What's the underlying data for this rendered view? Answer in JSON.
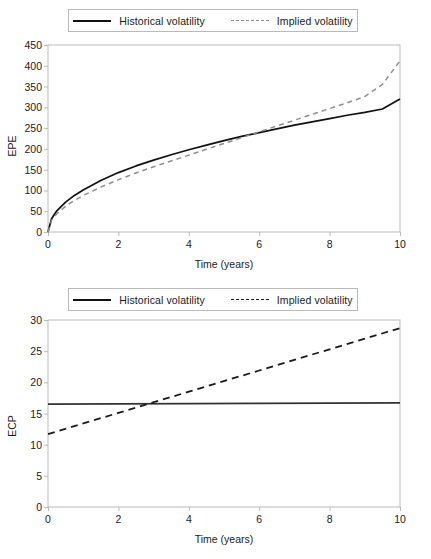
{
  "chart_data": [
    {
      "type": "line",
      "id": "epe-chart",
      "title": "",
      "xlabel": "Time (years)",
      "ylabel": "EPE",
      "xlim": [
        0,
        10
      ],
      "ylim": [
        0,
        450
      ],
      "xticks": [
        0,
        2,
        4,
        6,
        8,
        10
      ],
      "yticks": [
        0,
        50,
        100,
        150,
        200,
        250,
        300,
        350,
        400,
        450
      ],
      "grid": false,
      "legend_position": "top-center",
      "x": [
        0,
        0.1,
        0.25,
        0.5,
        0.75,
        1,
        1.5,
        2,
        2.5,
        3,
        3.5,
        4,
        4.5,
        5,
        5.5,
        6,
        6.5,
        7,
        7.5,
        8,
        8.5,
        9,
        9.5,
        10
      ],
      "series": [
        {
          "name": "Historical volatility",
          "style": "solid",
          "color": "#111111",
          "values": [
            0,
            32,
            51,
            72,
            88,
            101,
            124,
            143,
            159,
            173,
            186,
            198,
            209,
            220,
            230,
            239,
            248,
            257,
            265,
            273,
            281,
            288,
            296,
            320
          ]
        },
        {
          "name": "Implied volatility",
          "style": "dashed",
          "color": "#8e8e8e",
          "values": [
            0,
            28,
            44,
            62,
            76,
            88,
            108,
            126,
            142,
            157,
            171,
            185,
            199,
            213,
            227,
            241,
            255,
            269,
            283,
            297,
            311,
            326,
            355,
            412
          ]
        }
      ]
    },
    {
      "type": "line",
      "id": "ecp-chart",
      "title": "",
      "xlabel": "Time (years)",
      "ylabel": "ECP",
      "xlim": [
        0,
        10
      ],
      "ylim": [
        0,
        30
      ],
      "xticks": [
        0,
        2,
        4,
        6,
        8,
        10
      ],
      "yticks": [
        0,
        5,
        10,
        15,
        20,
        25,
        30
      ],
      "grid": false,
      "legend_position": "top-center",
      "x": [
        0,
        2,
        4,
        6,
        8,
        10
      ],
      "series": [
        {
          "name": "Historical volatility",
          "style": "solid",
          "color": "#333333",
          "values": [
            16.5,
            16.54,
            16.58,
            16.62,
            16.66,
            16.7
          ]
        },
        {
          "name": "Implied volatility",
          "style": "dashed",
          "color": "#1b1b1b",
          "values": [
            11.7,
            15.1,
            18.5,
            21.9,
            25.3,
            28.7
          ]
        }
      ]
    }
  ],
  "panels": [
    {
      "legend": [
        {
          "label": "Historical volatility",
          "swatch": "solid-line-swatch"
        },
        {
          "label": "Implied volatility",
          "swatch": "dashed-line-swatch"
        }
      ]
    },
    {
      "legend": [
        {
          "label": "Historical volatility",
          "swatch": "solid-line-swatch"
        },
        {
          "label": "Implied volatility",
          "swatch": "dashed-line-swatch"
        }
      ]
    }
  ],
  "colors": {
    "axis": "#b9b9b9",
    "text": "#1a1a1a",
    "series_solid": "#111111",
    "series_dashed_top": "#8e8e8e",
    "series_dashed_bottom": "#1b1b1b",
    "background": "#ffffff"
  }
}
